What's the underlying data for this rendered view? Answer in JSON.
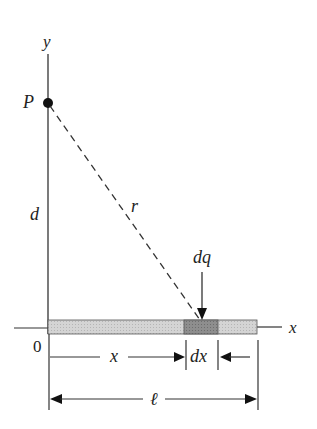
{
  "diagram": {
    "labels": {
      "y_axis": "y",
      "x_axis": "x",
      "point": "P",
      "distance_d": "d",
      "distance_r": "r",
      "charge_element": "dq",
      "origin": "0",
      "position_x": "x",
      "width_dx": "dx",
      "length": "ℓ"
    },
    "colors": {
      "line": "#333333",
      "rod": "#d0d0d0",
      "rod_element": "#8a8a8a",
      "point": "#111111"
    }
  }
}
